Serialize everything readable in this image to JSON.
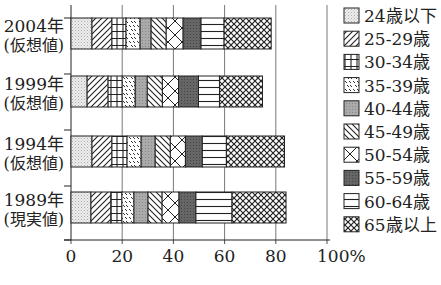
{
  "chart_data": {
    "type": "bar",
    "orientation": "horizontal",
    "stacked": true,
    "title": "",
    "xlabel": "",
    "ylabel": "",
    "xlim": [
      0,
      100
    ],
    "x_ticks": [
      "0",
      "20",
      "40",
      "60",
      "80",
      "100%"
    ],
    "grid": "vertical",
    "legend_position": "right",
    "categories": [
      {
        "year": "2004年",
        "note": "(仮想値)"
      },
      {
        "year": "1999年",
        "note": "(仮想値)"
      },
      {
        "year": "1994年",
        "note": "(仮想値)"
      },
      {
        "year": "1989年",
        "note": "(現実値)"
      }
    ],
    "series": [
      {
        "name": "24歳以下",
        "pattern": "dots",
        "values": [
          8.2,
          6.3,
          8.2,
          7.8
        ]
      },
      {
        "name": "25-29歳",
        "pattern": "diag-fwd",
        "values": [
          7.8,
          8.2,
          7.8,
          7.8
        ]
      },
      {
        "name": "30-34歳",
        "pattern": "grid",
        "values": [
          5.5,
          5.5,
          5.9,
          4.3
        ]
      },
      {
        "name": "35-39歳",
        "pattern": "dashes",
        "values": [
          5.5,
          5.1,
          5.5,
          4.7
        ]
      },
      {
        "name": "40-44歳",
        "pattern": "gray-light",
        "values": [
          4.3,
          4.7,
          5.5,
          5.5
        ]
      },
      {
        "name": "45-49歳",
        "pattern": "diag-back",
        "values": [
          5.9,
          5.9,
          5.9,
          5.5
        ]
      },
      {
        "name": "50-54歳",
        "pattern": "cross-diag",
        "values": [
          6.6,
          6.3,
          5.9,
          6.6
        ]
      },
      {
        "name": "55-59歳",
        "pattern": "gray-dark",
        "values": [
          7.0,
          7.8,
          6.6,
          6.6
        ]
      },
      {
        "name": "60-64歳",
        "pattern": "horizontal",
        "values": [
          9.0,
          8.2,
          9.4,
          14.1
        ]
      },
      {
        "name": "65歳以上",
        "pattern": "crosshatch",
        "values": [
          18.4,
          16.8,
          22.7,
          21.1
        ]
      }
    ]
  }
}
